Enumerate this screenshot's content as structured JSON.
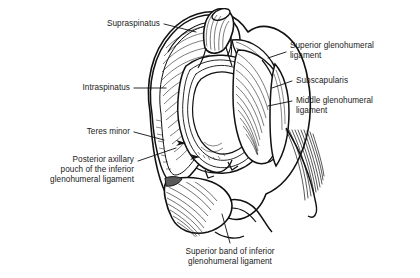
{
  "figure": {
    "style": {
      "ink": "#111111",
      "background": "#ffffff",
      "fill_light": "#ffffff",
      "fill_shadow": "#555555"
    }
  },
  "labels": [
    {
      "id": "supraspinatus",
      "text": "Supraspinatus",
      "align": "right",
      "x": 88,
      "y": 19,
      "width": 72,
      "leader": {
        "x1": 164,
        "y1": 24,
        "x2": 196,
        "y2": 32
      }
    },
    {
      "id": "intraspinatus",
      "text": "Intraspinatus",
      "align": "right",
      "x": 62,
      "y": 83,
      "width": 68,
      "leader": {
        "x1": 134,
        "y1": 88,
        "x2": 166,
        "y2": 88
      }
    },
    {
      "id": "teres-minor",
      "text": "Teres minor",
      "align": "right",
      "x": 60,
      "y": 127,
      "width": 70,
      "leader": {
        "x1": 134,
        "y1": 132,
        "x2": 164,
        "y2": 140
      }
    },
    {
      "id": "posterior-axillary-pouch",
      "text": "Posterior axillary\npouch of the inferior\nglenohumeral ligament",
      "align": "right",
      "x": 26,
      "y": 155,
      "width": 108,
      "leader": {
        "x1": 138,
        "y1": 161,
        "x2": 176,
        "y2": 148
      }
    },
    {
      "id": "superior-glenohumeral-ligament",
      "text": "Superior glenohumeral\nligament",
      "align": "left",
      "x": 290,
      "y": 41,
      "width": 124,
      "leader": {
        "x1": 286,
        "y1": 52,
        "x2": 268,
        "y2": 58
      }
    },
    {
      "id": "subscapularis",
      "text": "Subscapularis",
      "align": "left",
      "x": 296,
      "y": 76,
      "width": 120,
      "leader": {
        "x1": 292,
        "y1": 81,
        "x2": 272,
        "y2": 88
      }
    },
    {
      "id": "middle-glenohumeral-ligament",
      "text": "Middle glenohumeral\nligament",
      "align": "left",
      "x": 296,
      "y": 96,
      "width": 120,
      "leader": {
        "x1": 292,
        "y1": 101,
        "x2": 268,
        "y2": 106
      }
    },
    {
      "id": "superior-band-inferior-glenohumeral-ligament",
      "text": "Superior band of inferior\nglenohumeral ligament",
      "align": "center",
      "x": 163,
      "y": 247,
      "width": 134,
      "leader": {
        "x1": 230,
        "y1": 243,
        "x2": 222,
        "y2": 214
      }
    }
  ]
}
